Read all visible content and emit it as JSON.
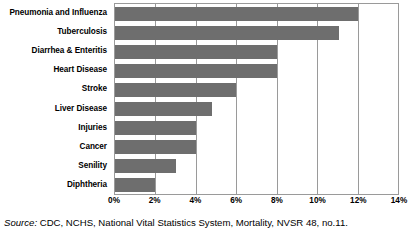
{
  "chart_data": {
    "type": "bar",
    "orientation": "horizontal",
    "title": "",
    "subtitle": "",
    "xlabel": "",
    "ylabel": "",
    "xlim": [
      0,
      14
    ],
    "grid": true,
    "legend": null,
    "categories": [
      "Pneumonia and Influenza",
      "Tuberculosis",
      "Diarrhea & Enteritis",
      "Heart Disease",
      "Stroke",
      "Liver Disease",
      "Injuries",
      "Cancer",
      "Senility",
      "Diphtheria"
    ],
    "values": [
      12.0,
      11.1,
      8.0,
      8.0,
      6.0,
      4.8,
      4.0,
      4.0,
      3.0,
      2.0
    ],
    "value_unit": "%",
    "xticks": [
      0,
      2,
      4,
      6,
      8,
      10,
      12,
      14
    ],
    "xtick_labels": [
      "0%",
      "2%",
      "4%",
      "6%",
      "8%",
      "10%",
      "12%",
      "14%"
    ],
    "bar_color": "#6e6e6e",
    "axis_color": "#9a9a9a",
    "plot_background": "#ffffff"
  },
  "footnote": {
    "source_word": "Source:",
    "source_text": " CDC, NCHS, National Vital Statistics System, Mortality, NVSR 48, no.11."
  }
}
